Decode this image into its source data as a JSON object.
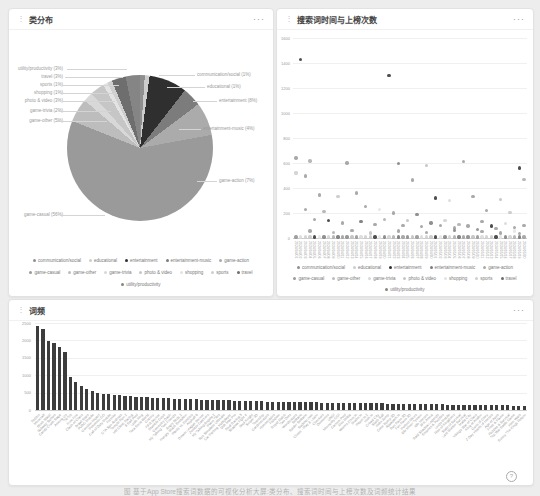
{
  "page": {
    "handle_glyph": "⋮",
    "panel_menu": "···",
    "help_glyph": "?",
    "caption": "图 基于App Store搜索词数据的可视化分析大屏:类分布、搜索词时间与上榜次数及词频统计结果"
  },
  "categories": [
    {
      "name": "communication/social",
      "color": "#8f8f8f"
    },
    {
      "name": "educational",
      "color": "#cdcdcd"
    },
    {
      "name": "entertainment",
      "color": "#2f2f2f"
    },
    {
      "name": "entertainment-music",
      "color": "#7c7c7c"
    },
    {
      "name": "game-action",
      "color": "#ababab"
    },
    {
      "name": "game-casual",
      "color": "#9a9a9a"
    },
    {
      "name": "game-other",
      "color": "#bdbdbd"
    },
    {
      "name": "game-trivia",
      "color": "#d8d8d8"
    },
    {
      "name": "photo & video",
      "color": "#c6c6c6"
    },
    {
      "name": "shopping",
      "color": "#e3e3e3"
    },
    {
      "name": "sports",
      "color": "#cfcfcf"
    },
    {
      "name": "travel",
      "color": "#6e6e6e"
    },
    {
      "name": "utility/productivity",
      "color": "#858585"
    }
  ],
  "chart_data": [
    {
      "id": "category-pie",
      "type": "pie",
      "title": "类分布",
      "unit": "%",
      "legend_position": "bottom",
      "labels": [
        "communication/social",
        "educational",
        "entertainment",
        "entertainment-music",
        "game-action",
        "game-casual",
        "game-other",
        "game-trivia",
        "photo & video",
        "shopping",
        "sports",
        "travel",
        "utility/productivity"
      ],
      "values": [
        1,
        1,
        8,
        4,
        7,
        56,
        5,
        2,
        3,
        1,
        1,
        3,
        3
      ]
    },
    {
      "id": "time-rank-scatter",
      "type": "scatter",
      "title": "搜索词时间与上榜次数",
      "ylim": [
        0,
        1600
      ],
      "ytick_step": 200,
      "grid": true,
      "legend_position": "bottom",
      "x": [
        "2024/04/01",
        "2024/04/02",
        "2024/04/03",
        "2024/04/04",
        "2024/04/05",
        "2024/04/06",
        "2024/04/07",
        "2024/04/08",
        "2024/04/09",
        "2024/04/10",
        "2024/04/11",
        "2024/04/12",
        "2024/04/13",
        "2024/04/14",
        "2024/04/15",
        "2024/04/16",
        "2024/04/17",
        "2024/04/18",
        "2024/04/19",
        "2024/04/20",
        "2024/04/21",
        "2024/04/22",
        "2024/04/23",
        "2024/04/24",
        "2024/04/25",
        "2024/04/26",
        "2024/04/27",
        "2024/04/28",
        "2024/04/29",
        "2024/04/30",
        "2024/05/01",
        "2024/05/02",
        "2024/05/03",
        "2024/05/04",
        "2024/05/05",
        "2024/05/06",
        "2024/05/07",
        "2024/05/08",
        "2024/05/09",
        "2024/05/10",
        "2024/05/11",
        "2024/05/12",
        "2024/05/13",
        "2024/05/14",
        "2024/05/15",
        "2024/05/16",
        "2024/05/17",
        "2024/05/18",
        "2024/05/19",
        "2024/05/20"
      ],
      "baseline_value": 8,
      "points": [
        [
          1,
          1430,
          2
        ],
        [
          20,
          1300,
          2
        ],
        [
          0,
          640,
          5
        ],
        [
          3,
          615,
          4
        ],
        [
          11,
          600,
          5
        ],
        [
          22,
          598,
          3
        ],
        [
          28,
          580,
          6
        ],
        [
          36,
          612,
          5
        ],
        [
          48,
          560,
          2
        ],
        [
          49,
          470,
          4
        ],
        [
          0,
          520,
          1
        ],
        [
          2,
          495,
          5
        ],
        [
          25,
          465,
          5
        ],
        [
          5,
          345,
          5
        ],
        [
          9,
          330,
          8
        ],
        [
          13,
          360,
          5
        ],
        [
          30,
          320,
          2
        ],
        [
          33,
          300,
          7
        ],
        [
          38,
          330,
          5
        ],
        [
          44,
          310,
          6
        ],
        [
          2,
          230,
          5
        ],
        [
          6,
          210,
          4
        ],
        [
          15,
          250,
          5
        ],
        [
          18,
          230,
          9
        ],
        [
          21,
          200,
          5
        ],
        [
          26,
          190,
          3
        ],
        [
          41,
          220,
          5
        ],
        [
          46,
          205,
          8
        ],
        [
          4,
          150,
          5
        ],
        [
          7,
          140,
          2
        ],
        [
          10,
          120,
          5
        ],
        [
          14,
          130,
          11
        ],
        [
          17,
          110,
          5
        ],
        [
          19,
          150,
          4
        ],
        [
          23,
          100,
          5
        ],
        [
          24,
          140,
          6
        ],
        [
          27,
          90,
          5
        ],
        [
          29,
          120,
          3
        ],
        [
          31,
          100,
          5
        ],
        [
          32,
          140,
          10
        ],
        [
          34,
          80,
          5
        ],
        [
          35,
          110,
          4
        ],
        [
          37,
          95,
          5
        ],
        [
          39,
          70,
          12
        ],
        [
          40,
          130,
          5
        ],
        [
          42,
          95,
          2
        ],
        [
          43,
          75,
          5
        ],
        [
          45,
          115,
          7
        ],
        [
          47,
          85,
          5
        ],
        [
          49,
          100,
          5
        ],
        [
          3,
          55,
          5
        ],
        [
          8,
          45,
          4
        ],
        [
          12,
          60,
          5
        ],
        [
          16,
          40,
          6
        ],
        [
          22,
          55,
          5
        ],
        [
          28,
          45,
          5
        ],
        [
          34,
          60,
          3
        ],
        [
          40,
          50,
          5
        ],
        [
          44,
          40,
          5
        ],
        [
          47,
          55,
          9
        ],
        [
          48,
          35,
          5
        ]
      ]
    },
    {
      "id": "term-frequency-bar",
      "type": "bar",
      "title": "词频",
      "ylim": [
        0,
        2500
      ],
      "ytick_step": 500,
      "grid": true,
      "bar_color": "#3d3d3d",
      "categories": [
        "Roblox",
        "Minecraft",
        "Block Blast!",
        "Subway Surfers",
        "Candy Crush Saga",
        "Among Us",
        "TikTok",
        "Free Fire",
        "Clash of Clans",
        "Brawl Stars",
        "PUBG Mobile",
        "Genshin Impact",
        "Pokemon GO",
        "Call of Duty Mobile",
        "Fortnite",
        "GTA San Andreas",
        "Temple Run 2",
        "Hill Climb Racing",
        "8 Ball Pool",
        "Ludo King",
        "Toca Boca World",
        "Granny",
        "FIFA Soccer",
        "Stumble Guys",
        "Geometry Dash",
        "My Talking Tom Friends",
        "Angry Birds 2",
        "Hungry Shark Evolution",
        "Plants vs Zombies",
        "Asphalt 9",
        "Dream League Soccer",
        "Zombie Catchers",
        "My Talking Angela 2",
        "Piano Tiles",
        "Bus Simulator Ultimate",
        "Car Parking Multiplayer",
        "Drift Max Pro",
        "Real Racing 3",
        "Shadow Fight 4",
        "Soul Knight",
        "Sniper 3D",
        "Township",
        "Gardenscapes",
        "Homescapes",
        "Fishdom",
        "Royal Match",
        "Two Dots",
        "Wordscapes",
        "Solitaire",
        "Spider Solitaire",
        "Sudoku.com",
        "Chess - Play & Learn",
        "Checkers",
        "Dominoes",
        "UNO!",
        "Monopoly GO!",
        "Carrom Pool",
        "Mini Militia",
        "Worms Zone.io",
        "Snake.io",
        "Paper.io 2",
        "Hole.io",
        "Crowd City",
        "Stack Ball",
        "Helix Jump",
        "Color Bump 3D",
        "Aquapark.io",
        "Run Race 3D",
        "Fun Race 3D",
        "Perfect Slices",
        "Idle Miner Tycoon",
        "Idle Heroes",
        "AFK Arena",
        "Raid Shadow Legends",
        "Empires & Puzzles",
        "Lords Mobile",
        "Rise of Kingdoms",
        "State of Survival",
        "Last Shelter Survival",
        "Mafia City",
        "Vikings War of Clans",
        "King of Avalon",
        "Guns of Glory",
        "Z Day Hearts of Heroes",
        "Age of Apes",
        "Frost & Flame",
        "Puzzles & Survival",
        "Top War Battle Game",
        "Hero Wars",
        "Evony The Kings Return"
      ],
      "values": [
        2420,
        2330,
        1980,
        1920,
        1820,
        1680,
        950,
        800,
        680,
        590,
        540,
        500,
        470,
        450,
        435,
        420,
        405,
        395,
        385,
        375,
        365,
        355,
        350,
        345,
        340,
        330,
        325,
        320,
        315,
        310,
        300,
        295,
        290,
        285,
        280,
        275,
        270,
        265,
        260,
        255,
        250,
        245,
        240,
        238,
        235,
        232,
        230,
        228,
        225,
        222,
        220,
        218,
        215,
        212,
        210,
        208,
        205,
        202,
        200,
        198,
        195,
        192,
        190,
        188,
        185,
        182,
        180,
        178,
        175,
        172,
        170,
        168,
        165,
        162,
        160,
        158,
        155,
        152,
        150,
        148,
        145,
        142,
        140,
        138,
        135,
        132,
        130,
        128,
        125,
        122
      ]
    }
  ]
}
